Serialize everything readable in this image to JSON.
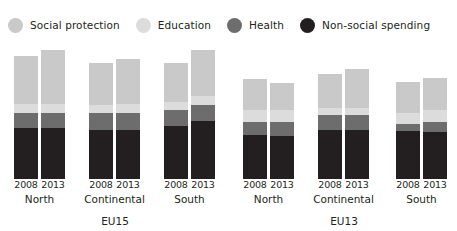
{
  "legend": {
    "position": "top-left",
    "items": [
      {
        "label": "Social protection",
        "color": "#c9c9c9",
        "key": "social_protection"
      },
      {
        "label": "Education",
        "color": "#dcdcdc",
        "key": "education"
      },
      {
        "label": "Health",
        "color": "#6d6d6d",
        "key": "health"
      },
      {
        "label": "Non-social spending",
        "color": "#231f20",
        "key": "non_social"
      }
    ]
  },
  "chart_data": {
    "type": "bar",
    "subtype": "stacked",
    "title": "",
    "subtitle": "",
    "xlabel": "",
    "ylabel": "",
    "grid": false,
    "ylim": [
      0,
      55
    ],
    "legend_position": "top-left",
    "series": [
      {
        "name": "Social protection",
        "color": "#c9c9c9",
        "values": [
          18.5,
          20.5,
          16.0,
          17.0,
          15.0,
          17.5,
          12.0,
          10.5,
          13.0,
          15.0,
          12.0,
          12.5
        ]
      },
      {
        "name": "Education",
        "color": "#dcdcdc",
        "values": [
          3.5,
          3.5,
          3.0,
          3.5,
          3.0,
          3.5,
          4.5,
          4.5,
          3.0,
          3.0,
          4.5,
          4.5
        ]
      },
      {
        "name": "Health",
        "color": "#6d6d6d",
        "values": [
          6.0,
          6.0,
          6.5,
          6.5,
          6.0,
          6.0,
          5.0,
          5.5,
          5.5,
          5.5,
          2.5,
          4.0
        ]
      },
      {
        "name": "Non-social spending",
        "color": "#231f20",
        "values": [
          19.5,
          19.5,
          19.0,
          19.0,
          20.5,
          22.5,
          17.0,
          16.5,
          19.0,
          19.0,
          18.5,
          18.0
        ]
      }
    ],
    "categories": [
      "EU15 North 2008",
      "EU15 North 2013",
      "EU15 Continental 2008",
      "EU15 Continental 2013",
      "EU15 South 2008",
      "EU15 South 2013",
      "EU13 North 2008",
      "EU13 North 2013",
      "EU13 Continental 2008",
      "EU13 Continental 2013",
      "EU13 South 2008",
      "EU13 South 2013"
    ],
    "totals": [
      47.5,
      49.5,
      44.5,
      46.0,
      44.5,
      49.5,
      38.5,
      37.0,
      40.5,
      42.5,
      37.5,
      39.0
    ]
  },
  "axis": {
    "supergroups": [
      {
        "label": "EU15",
        "groups": [
          {
            "region": "North",
            "years": [
              "2008",
              "2013"
            ]
          },
          {
            "region": "Continental",
            "years": [
              "2008",
              "2013"
            ]
          },
          {
            "region": "South",
            "years": [
              "2008",
              "2013"
            ]
          }
        ]
      },
      {
        "label": "EU13",
        "groups": [
          {
            "region": "North",
            "years": [
              "2008",
              "2013"
            ]
          },
          {
            "region": "Continental",
            "years": [
              "2008",
              "2013"
            ]
          },
          {
            "region": "South",
            "years": [
              "2008",
              "2013"
            ]
          }
        ]
      }
    ]
  },
  "layout": {
    "bar_width": 24,
    "pair_gap": 3,
    "group_lefts": [
      14,
      89,
      164,
      243,
      318,
      396
    ],
    "supergroup_label_centers": [
      115,
      344
    ],
    "plot_height": 137,
    "value_scale_px_per_unit": 2.6
  }
}
